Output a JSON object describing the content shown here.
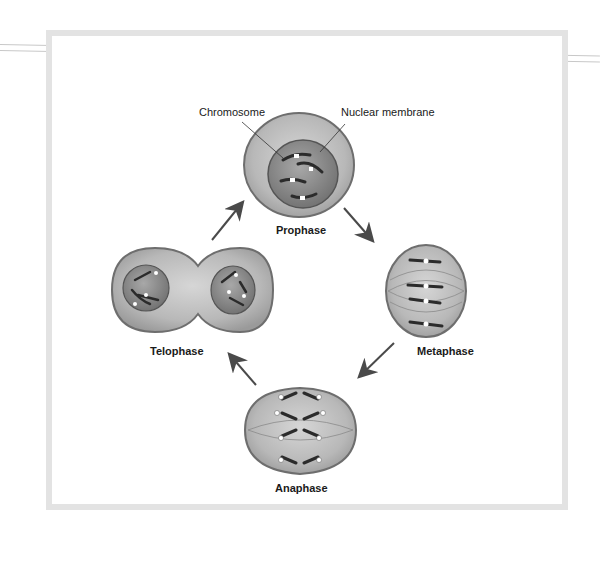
{
  "figure": {
    "callouts": {
      "chromosome": "Chromosome",
      "nuclear_membrane": "Nuclear membrane"
    },
    "stages": [
      {
        "id": "prophase",
        "label": "Prophase"
      },
      {
        "id": "metaphase",
        "label": "Metaphase"
      },
      {
        "id": "anaphase",
        "label": "Anaphase"
      },
      {
        "id": "telophase",
        "label": "Telophase"
      }
    ],
    "arrows": [
      {
        "from": "prophase",
        "to": "metaphase"
      },
      {
        "from": "metaphase",
        "to": "anaphase"
      },
      {
        "from": "anaphase",
        "to": "telophase"
      },
      {
        "from": "telophase",
        "to": "prophase"
      }
    ],
    "colors": {
      "cell_fill": "#b5b5b5",
      "cell_edge": "#6e6e6e",
      "nucleus_fill": "#8a8a8a",
      "chromosome": "#2b2b2b",
      "arrow": "#4a4a4a",
      "frame": "#e3e3e3"
    }
  }
}
